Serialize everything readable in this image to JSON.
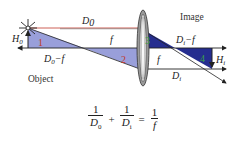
{
  "diagram": {
    "type": "thin-lens ray diagram",
    "labels": {
      "object_distance": "D",
      "object_distance_sub": "0",
      "object_height": "H",
      "object_height_sub": "0",
      "object_minus_f": "D",
      "object_minus_f_sub": "0",
      "object_minus_f_tail": "−f",
      "focal_left": "f",
      "focal_right": "f",
      "image_minus_f": "D",
      "image_minus_f_sub": "i",
      "image_minus_f_tail": "−f",
      "image_height": "H",
      "image_height_sub": "i",
      "image_distance": "D",
      "image_distance_sub": "i",
      "object_word": "Object",
      "image_word": "Image"
    },
    "triangles": [
      {
        "id": "1",
        "label": "1",
        "fill": "#8e95d6"
      },
      {
        "id": "2",
        "label": "2",
        "fill": "#8e95d6"
      },
      {
        "id": "3",
        "label": "3",
        "fill": "#252d8f"
      },
      {
        "id": "4",
        "label": "4",
        "fill": "#252d8f"
      }
    ],
    "colors": {
      "light_triangle": "#8e95d6",
      "dark_triangle": "#252d8f",
      "light_number": "#c0392b",
      "dark_number": "#3aa14a",
      "lines": "#222222",
      "top_ray": "#c0392b"
    }
  },
  "formula": {
    "term1_num": "1",
    "term1_den": "D",
    "term1_den_sub": "0",
    "plus": "+",
    "term2_num": "1",
    "term2_den": "D",
    "term2_den_sub": "i",
    "equals": "=",
    "term3_num": "1",
    "term3_den": "f"
  }
}
